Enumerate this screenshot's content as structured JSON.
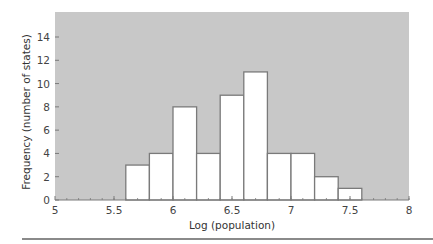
{
  "chart_data": {
    "type": "bar",
    "subtype": "histogram",
    "title": "",
    "xlabel": "Log (population)",
    "ylabel": "Frequency (number of states)",
    "xlim": [
      5,
      8
    ],
    "ylim": [
      0,
      16
    ],
    "x_ticks": [
      5,
      5.5,
      6,
      6.5,
      7,
      7.5,
      8
    ],
    "x_tick_labels": [
      "5",
      "5.5",
      "6",
      "6.5",
      "7",
      "7.5",
      "8"
    ],
    "y_ticks": [
      0,
      2,
      4,
      6,
      8,
      10,
      12,
      14
    ],
    "y_tick_labels": [
      "0",
      "2",
      "4",
      "6",
      "8",
      "10",
      "12",
      "14"
    ],
    "bin_width": 0.2,
    "bins": [
      {
        "start": 5.6,
        "end": 5.8,
        "value": 3
      },
      {
        "start": 5.8,
        "end": 6.0,
        "value": 4
      },
      {
        "start": 6.0,
        "end": 6.2,
        "value": 8
      },
      {
        "start": 6.2,
        "end": 6.4,
        "value": 4
      },
      {
        "start": 6.4,
        "end": 6.6,
        "value": 9
      },
      {
        "start": 6.6,
        "end": 6.8,
        "value": 11
      },
      {
        "start": 6.8,
        "end": 7.0,
        "value": 4
      },
      {
        "start": 7.0,
        "end": 7.2,
        "value": 4
      },
      {
        "start": 7.2,
        "end": 7.4,
        "value": 2
      },
      {
        "start": 7.4,
        "end": 7.6,
        "value": 1
      }
    ],
    "categories": [
      "5.6-5.8",
      "5.8-6.0",
      "6.0-6.2",
      "6.2-6.4",
      "6.4-6.6",
      "6.6-6.8",
      "6.8-7.0",
      "7.0-7.2",
      "7.2-7.4",
      "7.4-7.6"
    ],
    "values": [
      3,
      4,
      8,
      4,
      9,
      11,
      4,
      4,
      2,
      1
    ],
    "grid": false,
    "legend": null,
    "colors": {
      "plot_background": "#c8c8c8",
      "bar_fill": "#ffffff",
      "bar_edge": "#7a7a7a",
      "axis": "#7a7a7a"
    }
  }
}
